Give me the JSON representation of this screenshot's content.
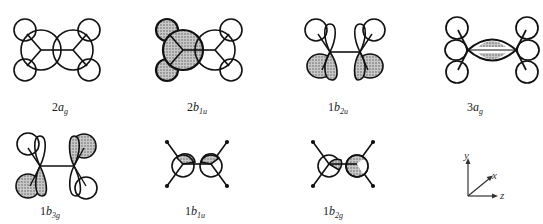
{
  "figure": {
    "colors": {
      "line": "#111111",
      "shade": "#9a9a9a",
      "background": "#ffffff"
    }
  },
  "orbitals": [
    {
      "id": "2ag",
      "num": "2",
      "sym": "b",
      "label_main": "a",
      "sub": "g",
      "row": 1,
      "col": 1
    },
    {
      "id": "2b1u",
      "num": "2",
      "label_main": "b",
      "sub": "1u",
      "row": 1,
      "col": 2
    },
    {
      "id": "1b2u",
      "num": "1",
      "label_main": "b",
      "sub": "2u",
      "row": 1,
      "col": 3
    },
    {
      "id": "3ag",
      "num": "3",
      "label_main": "a",
      "sub": "g",
      "row": 1,
      "col": 4
    },
    {
      "id": "1b3g",
      "num": "1",
      "label_main": "b",
      "sub": "3g",
      "row": 2,
      "col": 1
    },
    {
      "id": "1b1u",
      "num": "1",
      "label_main": "b",
      "sub": "1u",
      "row": 2,
      "col": 2
    },
    {
      "id": "1b2g",
      "num": "1",
      "label_main": "b",
      "sub": "2g",
      "row": 2,
      "col": 3
    }
  ],
  "axes": {
    "y_label": "y",
    "x_label": "x",
    "z_label": "z"
  }
}
